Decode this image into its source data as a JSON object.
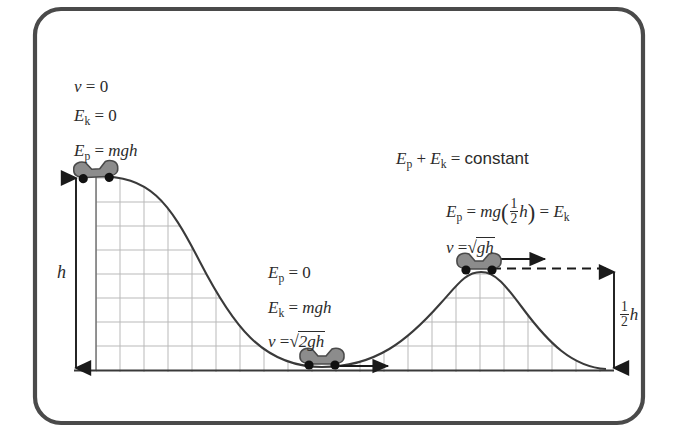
{
  "figure": {
    "kind": "physics-diagram",
    "topic": "conservation-of-mechanical-energy-roller-coaster",
    "frame": {
      "border_color": "#4a4a4a",
      "background": "#ffffff",
      "corner_radius": 26
    },
    "colors": {
      "track": "#3a3a3a",
      "grid": "#b9b9b9",
      "baseline": "#3a3a3a",
      "cart_body": "#8c8c8c",
      "cart_outline": "#4a4a4a",
      "wheel": "#111111",
      "arrow": "#1a1a1a",
      "text": "#2b2b2b"
    },
    "annotations": {
      "top_left": {
        "name": "top-of-first-hill-labels",
        "lines": [
          {
            "id": "v-zero",
            "lhs": "v",
            "rel": "=",
            "rhs": "0"
          },
          {
            "id": "ek-zero",
            "lhs": "E",
            "sub": "k",
            "rel": "=",
            "rhs": "0"
          },
          {
            "id": "ep-mgh",
            "lhs": "E",
            "sub": "p",
            "rel": "=",
            "rhs": "mgh"
          }
        ]
      },
      "valley": {
        "name": "bottom-of-valley-labels",
        "lines": [
          {
            "id": "ep-zero",
            "lhs": "E",
            "sub": "p",
            "rel": "=",
            "rhs": "0"
          },
          {
            "id": "ek-mgh",
            "lhs": "E",
            "sub": "k",
            "rel": "=",
            "rhs": "mgh"
          },
          {
            "id": "v-sqrt-2gh",
            "lhs": "v",
            "rel": "=",
            "radicand": "2gh"
          }
        ]
      },
      "constant": {
        "name": "energy-constant-statement",
        "lhs_1": "E",
        "sub_1": "p",
        "plus": "+",
        "lhs_2": "E",
        "sub_2": "k",
        "rel": "=",
        "rhs": "constant"
      },
      "second_hill": {
        "name": "top-of-second-hill-labels",
        "line_1": {
          "id": "ep-half-mgh",
          "lhs": "E",
          "sub": "p",
          "rel": "=",
          "mg": "mg",
          "frac_num": "1",
          "frac_den": "2",
          "var": "h",
          "rel2": "=",
          "rhs": "E",
          "rhs_sub": "k"
        },
        "line_2": {
          "id": "v-sqrt-gh",
          "lhs": "v",
          "rel": "=",
          "radicand": "gh"
        }
      }
    },
    "measures": {
      "height_full": {
        "name": "h-dimension",
        "label": "h",
        "arrow": "double-headed-vertical"
      },
      "height_half": {
        "name": "half-h-dimension",
        "frac_num": "1",
        "frac_den": "2",
        "var": "h",
        "arrow": "double-headed-vertical"
      }
    },
    "carts": [
      {
        "id": "cart-top-hill-1",
        "x": 96,
        "y": 174,
        "velocity_arrow": false
      },
      {
        "id": "cart-valley",
        "x": 322,
        "y": 362,
        "velocity_arrow": true
      },
      {
        "id": "cart-top-hill-2",
        "x": 481,
        "y": 267,
        "velocity_arrow": true
      }
    ],
    "track": {
      "name": "roller-coaster-track",
      "baseline_y": 370,
      "hill1_peak": {
        "x": 96,
        "y": 176
      },
      "valley_bottom": {
        "x": 322,
        "y": 367
      },
      "hill2_peak": {
        "x": 481,
        "y": 272
      },
      "grid_spacing": 24
    }
  }
}
